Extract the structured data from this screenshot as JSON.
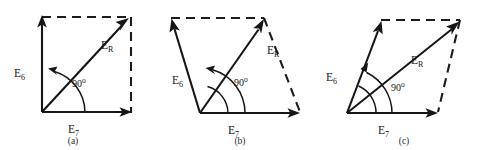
{
  "figure": {
    "line_color": "#161616",
    "background_color": "#ffffff",
    "panels": [
      {
        "id": "a",
        "caption": "(a)",
        "vectors": [
          {
            "name": "E6",
            "label_main": "E",
            "label_sub": "6",
            "style": "solid",
            "from": [
              42,
              112
            ],
            "to": [
              42,
              20
            ]
          },
          {
            "name": "E7",
            "label_main": "E",
            "label_sub": "7",
            "style": "solid",
            "from": [
              42,
              112
            ],
            "to": [
              131,
              112
            ]
          },
          {
            "name": "ER",
            "label_main": "E",
            "label_sub": "R",
            "style": "solid",
            "from": [
              42,
              112
            ],
            "to": [
              128,
              19
            ]
          }
        ],
        "dashed_sides": [
          {
            "from": [
              42,
              17
            ],
            "to": [
              131,
              17
            ]
          },
          {
            "from": [
              131,
              17
            ],
            "to": [
              131,
              112
            ]
          }
        ],
        "angle": {
          "value": "90",
          "unit": "o",
          "text": "90o",
          "at": [
            76,
            83
          ]
        },
        "label_positions": {
          "E6": [
            18,
            73
          ],
          "E7": [
            72,
            129
          ],
          "ER": [
            106,
            45
          ]
        }
      },
      {
        "id": "b",
        "caption": "(b)",
        "vectors": [
          {
            "name": "E6",
            "label_main": "E",
            "label_sub": "6",
            "style": "solid",
            "from": [
              200,
              113
            ],
            "to": [
              171,
              19
            ]
          },
          {
            "name": "E7",
            "label_main": "E",
            "label_sub": "7",
            "style": "solid",
            "from": [
              200,
              113
            ],
            "to": [
              299,
              113
            ]
          },
          {
            "name": "ER",
            "label_main": "E",
            "label_sub": "R",
            "style": "solid",
            "from": [
              200,
              113
            ],
            "to": [
              263,
              20
            ]
          }
        ],
        "dashed_sides": [
          {
            "from": [
              171,
              18
            ],
            "to": [
              263,
              18
            ]
          },
          {
            "from": [
              263,
              18
            ],
            "to": [
              299,
              111
            ]
          }
        ],
        "angle": {
          "value": "90",
          "unit": "o",
          "text": "90o",
          "at": [
            238,
            82
          ]
        },
        "label_positions": {
          "E6": [
            176,
            80
          ],
          "E7": [
            232,
            130
          ],
          "ER": [
            272,
            50
          ]
        }
      },
      {
        "id": "c",
        "caption": "(c)",
        "vectors": [
          {
            "name": "E6",
            "label_main": "E",
            "label_sub": "6",
            "style": "solid",
            "from": [
              347,
              113
            ],
            "to": [
              381,
              22
            ]
          },
          {
            "name": "E7",
            "label_main": "E",
            "label_sub": "7",
            "style": "solid",
            "from": [
              347,
              113
            ],
            "to": [
              437,
              113
            ]
          },
          {
            "name": "ER",
            "label_main": "E",
            "label_sub": "R",
            "style": "solid",
            "from": [
              347,
              113
            ],
            "to": [
              458,
              22
            ]
          }
        ],
        "dashed_sides": [
          {
            "from": [
              381,
              20
            ],
            "to": [
              459,
              20
            ]
          },
          {
            "from": [
              459,
              20
            ],
            "to": [
              437,
              112
            ]
          }
        ],
        "angle": {
          "value": "90",
          "unit": "o",
          "text": "90o",
          "at": [
            395,
            87
          ]
        },
        "label_positions": {
          "E6": [
            330,
            77
          ],
          "E7": [
            382,
            130
          ],
          "ER": [
            417,
            60
          ]
        }
      }
    ]
  }
}
